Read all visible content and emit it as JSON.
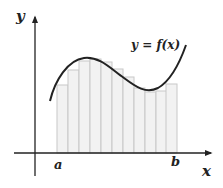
{
  "diagram": {
    "type": "riemann-sum",
    "labels": {
      "y_axis": "y",
      "x_axis": "x",
      "a": "a",
      "b": "b",
      "function": "y = f(x)"
    },
    "colors": {
      "axis": "#222222",
      "curve": "#222222",
      "bar_fill": "#f2f2f2",
      "bar_stroke": "#c8c8c8"
    },
    "bar_count": 11,
    "bars": [
      {
        "x": 57,
        "top": 85
      },
      {
        "x": 68,
        "top": 70
      },
      {
        "x": 79,
        "top": 61
      },
      {
        "x": 90,
        "top": 59
      },
      {
        "x": 101,
        "top": 62
      },
      {
        "x": 112,
        "top": 69
      },
      {
        "x": 123,
        "top": 77
      },
      {
        "x": 134,
        "top": 88
      },
      {
        "x": 145,
        "top": 92
      },
      {
        "x": 156,
        "top": 91
      },
      {
        "x": 166,
        "top": 84
      }
    ],
    "bar_width": 11,
    "baseline_y": 153
  }
}
